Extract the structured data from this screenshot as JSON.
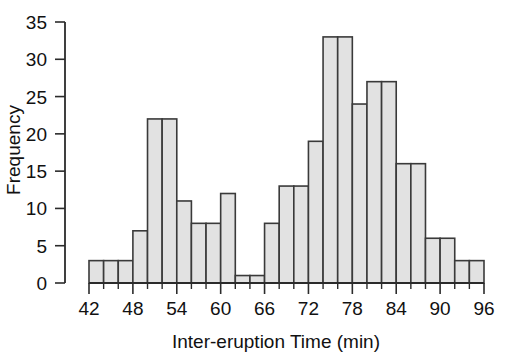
{
  "chart_data": {
    "type": "bar",
    "title": "",
    "xlabel": "Inter-eruption Time (min)",
    "ylabel": "Frequency",
    "xlim": [
      42,
      96
    ],
    "ylim": [
      0,
      35
    ],
    "grid": false,
    "legend": null,
    "bin_width": 2,
    "xtick_labels": [
      "42",
      "48",
      "54",
      "60",
      "66",
      "72",
      "78",
      "84",
      "90",
      "96"
    ],
    "xtick_values": [
      42,
      48,
      54,
      60,
      66,
      72,
      78,
      84,
      90,
      96
    ],
    "ytick_labels": [
      "0",
      "5",
      "10",
      "15",
      "20",
      "25",
      "30",
      "35"
    ],
    "ytick_values": [
      0,
      5,
      10,
      15,
      20,
      25,
      30,
      35
    ],
    "bins": [
      {
        "x0": 42,
        "x1": 44,
        "value": 3
      },
      {
        "x0": 44,
        "x1": 46,
        "value": 3
      },
      {
        "x0": 46,
        "x1": 48,
        "value": 3
      },
      {
        "x0": 48,
        "x1": 50,
        "value": 7
      },
      {
        "x0": 50,
        "x1": 52,
        "value": 22
      },
      {
        "x0": 52,
        "x1": 54,
        "value": 22
      },
      {
        "x0": 54,
        "x1": 56,
        "value": 11
      },
      {
        "x0": 56,
        "x1": 58,
        "value": 8
      },
      {
        "x0": 58,
        "x1": 60,
        "value": 8
      },
      {
        "x0": 60,
        "x1": 62,
        "value": 12
      },
      {
        "x0": 62,
        "x1": 64,
        "value": 1
      },
      {
        "x0": 64,
        "x1": 66,
        "value": 1
      },
      {
        "x0": 66,
        "x1": 68,
        "value": 8
      },
      {
        "x0": 68,
        "x1": 70,
        "value": 13
      },
      {
        "x0": 70,
        "x1": 72,
        "value": 13
      },
      {
        "x0": 72,
        "x1": 74,
        "value": 19
      },
      {
        "x0": 74,
        "x1": 76,
        "value": 33
      },
      {
        "x0": 76,
        "x1": 78,
        "value": 33
      },
      {
        "x0": 78,
        "x1": 80,
        "value": 24
      },
      {
        "x0": 80,
        "x1": 82,
        "value": 27
      },
      {
        "x0": 82,
        "x1": 84,
        "value": 27
      },
      {
        "x0": 84,
        "x1": 86,
        "value": 16
      },
      {
        "x0": 86,
        "x1": 88,
        "value": 16
      },
      {
        "x0": 88,
        "x1": 90,
        "value": 6
      },
      {
        "x0": 90,
        "x1": 92,
        "value": 6
      },
      {
        "x0": 92,
        "x1": 94,
        "value": 3
      },
      {
        "x0": 94,
        "x1": 96,
        "value": 3
      }
    ],
    "categories": [
      "42-44",
      "44-46",
      "46-48",
      "48-50",
      "50-52",
      "52-54",
      "54-56",
      "56-58",
      "58-60",
      "60-62",
      "62-64",
      "64-66",
      "66-68",
      "68-70",
      "70-72",
      "72-74",
      "74-76",
      "76-78",
      "78-80",
      "80-82",
      "82-84",
      "84-86",
      "86-88",
      "88-90",
      "90-92",
      "92-94",
      "94-96"
    ],
    "values": [
      3,
      3,
      3,
      7,
      22,
      22,
      11,
      8,
      8,
      12,
      1,
      1,
      8,
      13,
      13,
      19,
      33,
      33,
      24,
      27,
      27,
      16,
      16,
      6,
      6,
      3,
      3
    ],
    "colors": {
      "bar_fill": "#e2e2e2",
      "bar_stroke": "#3a3a3a",
      "axis": "#2b2b2b",
      "text": "#111111",
      "background": "#ffffff"
    }
  }
}
